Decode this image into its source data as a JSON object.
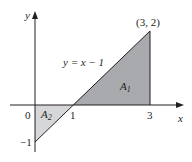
{
  "figure": {
    "axes": {
      "x_label": "x",
      "y_label": "y",
      "origin_label": "0",
      "x_ticks": [
        {
          "value": 1,
          "label": "1"
        },
        {
          "value": 3,
          "label": "3"
        }
      ],
      "y_ticks": [
        {
          "value": -1,
          "label": "−1"
        }
      ]
    },
    "curve": {
      "equation_label": "y = x − 1"
    },
    "point_label": "(3, 2)",
    "regions": [
      {
        "name": "A1",
        "label": "A",
        "subscript": "1",
        "vertices": [
          [
            1,
            0
          ],
          [
            3,
            0
          ],
          [
            3,
            2
          ]
        ],
        "color": "#a7a9ac"
      },
      {
        "name": "A2",
        "label": "A",
        "subscript": "2",
        "vertices": [
          [
            0,
            0
          ],
          [
            1,
            0
          ],
          [
            0,
            -1
          ]
        ],
        "color": "#d1d3d4"
      }
    ],
    "colors": {
      "axis": "#231f20",
      "line": "#231f20",
      "region_a1": "#a7a9ac",
      "region_a2": "#d1d3d4"
    }
  }
}
